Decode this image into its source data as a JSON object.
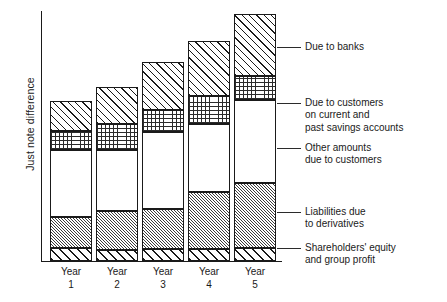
{
  "chart_data": {
    "type": "bar",
    "subtype": "stacked",
    "title": "",
    "xlabel": "",
    "ylabel": "Just note difference",
    "grid": false,
    "axis_tick_values_shown": false,
    "legend_position": "right-leader-lines",
    "categories": [
      "Year 1",
      "Year 2",
      "Year 3",
      "Year 4",
      "Year 5"
    ],
    "category_lines": [
      [
        "Year",
        "1"
      ],
      [
        "Year",
        "2"
      ],
      [
        "Year",
        "3"
      ],
      [
        "Year",
        "4"
      ],
      [
        "Year",
        "5"
      ]
    ],
    "series": [
      {
        "name": "Shareholders' equity and group profit",
        "pattern": "bold-diagonal-hatch",
        "values": [
          13,
          11,
          12,
          12,
          13
        ]
      },
      {
        "name": "Liabilities due to derivatives",
        "pattern": "fine-diagonal-hatch-gray",
        "values": [
          31,
          39,
          40,
          57,
          65
        ]
      },
      {
        "name": "Other amounts due to customers",
        "pattern": "plain-white",
        "values": [
          67,
          61,
          77,
          68,
          83
        ]
      },
      {
        "name": "Due to customers on current and past savings accounts",
        "pattern": "dot-grid-stipple",
        "values": [
          19,
          26,
          22,
          28,
          24
        ]
      },
      {
        "name": "Due to banks",
        "pattern": "medium-diagonal-hatch",
        "values": [
          30,
          37,
          48,
          55,
          62
        ]
      }
    ],
    "totals": [
      160,
      174,
      199,
      220,
      247
    ],
    "ylim": [
      0,
      249
    ]
  },
  "bars": [
    {
      "label_lines": [
        "Year",
        "1"
      ],
      "left": 50,
      "width": 42,
      "top": 101,
      "bottom": 261,
      "segments": [
        {
          "name": "banks",
          "top": 101,
          "bottom": 131
        },
        {
          "name": "savings",
          "top": 131,
          "bottom": 150
        },
        {
          "name": "other",
          "top": 150,
          "bottom": 217
        },
        {
          "name": "derivatives",
          "top": 217,
          "bottom": 248
        },
        {
          "name": "equity",
          "top": 248,
          "bottom": 261
        }
      ]
    },
    {
      "label_lines": [
        "Year",
        "2"
      ],
      "left": 96,
      "width": 42,
      "top": 87,
      "bottom": 261,
      "segments": [
        {
          "name": "banks",
          "top": 87,
          "bottom": 124
        },
        {
          "name": "savings",
          "top": 124,
          "bottom": 150
        },
        {
          "name": "other",
          "top": 150,
          "bottom": 211
        },
        {
          "name": "derivatives",
          "top": 211,
          "bottom": 250
        },
        {
          "name": "equity",
          "top": 250,
          "bottom": 261
        }
      ]
    },
    {
      "label_lines": [
        "Year",
        "3"
      ],
      "left": 142,
      "width": 42,
      "top": 62,
      "bottom": 261,
      "segments": [
        {
          "name": "banks",
          "top": 62,
          "bottom": 110
        },
        {
          "name": "savings",
          "top": 110,
          "bottom": 132
        },
        {
          "name": "other",
          "top": 132,
          "bottom": 209
        },
        {
          "name": "derivatives",
          "top": 209,
          "bottom": 249
        },
        {
          "name": "equity",
          "top": 249,
          "bottom": 261
        }
      ]
    },
    {
      "label_lines": [
        "Year",
        "4"
      ],
      "left": 188,
      "width": 42,
      "top": 41,
      "bottom": 261,
      "segments": [
        {
          "name": "banks",
          "top": 41,
          "bottom": 96
        },
        {
          "name": "savings",
          "top": 96,
          "bottom": 124
        },
        {
          "name": "other",
          "top": 124,
          "bottom": 192
        },
        {
          "name": "derivatives",
          "top": 192,
          "bottom": 249
        },
        {
          "name": "equity",
          "top": 249,
          "bottom": 261
        }
      ]
    },
    {
      "label_lines": [
        "Year",
        "5"
      ],
      "left": 234,
      "width": 42,
      "top": 14,
      "bottom": 261,
      "segments": [
        {
          "name": "banks",
          "top": 14,
          "bottom": 76
        },
        {
          "name": "savings",
          "top": 76,
          "bottom": 100
        },
        {
          "name": "other",
          "top": 100,
          "bottom": 183
        },
        {
          "name": "derivatives",
          "top": 183,
          "bottom": 248
        },
        {
          "name": "equity",
          "top": 248,
          "bottom": 261
        }
      ]
    }
  ],
  "legend": [
    {
      "key": "banks",
      "lines": [
        "Due to banks"
      ],
      "leader_y": 47,
      "text_x": 305,
      "text_y": 41,
      "leader_x": 277,
      "leader_w": 24
    },
    {
      "key": "savings",
      "lines": [
        "Due to customers",
        "on current and",
        "past savings accounts"
      ],
      "leader_y": 103,
      "text_x": 305,
      "text_y": 97,
      "leader_x": 277,
      "leader_w": 24
    },
    {
      "key": "other",
      "lines": [
        "Other amounts",
        "due to customers"
      ],
      "leader_y": 148,
      "text_x": 305,
      "text_y": 142,
      "leader_x": 277,
      "leader_w": 24
    },
    {
      "key": "derivatives",
      "lines": [
        "Liabilities due",
        "to derivatives"
      ],
      "leader_y": 212,
      "text_x": 305,
      "text_y": 206,
      "leader_x": 277,
      "leader_w": 24
    },
    {
      "key": "equity",
      "lines": [
        "Shareholders' equity",
        "and group profit"
      ],
      "leader_y": 248,
      "text_x": 305,
      "text_y": 242,
      "leader_x": 277,
      "leader_w": 24
    }
  ],
  "axes": {
    "y_label": "Just note difference"
  }
}
